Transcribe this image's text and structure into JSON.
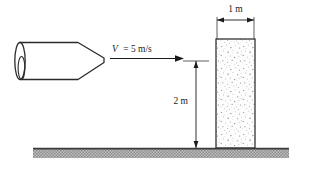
{
  "figure": {
    "labels": {
      "velocity": "V = 5 m/s",
      "velocity_symbol": "V",
      "velocity_value": "= 5 m/s",
      "wall_width": "1 m",
      "wall_height": "2 m"
    },
    "colors": {
      "line": "#1a1a1a",
      "outline": "#2b2b2b",
      "wall_fill": "#fdfdfd",
      "stipple": "#6b6b6b",
      "ground_fill": "#9a9a9a",
      "ground_line": "#3a3a3a",
      "background": "#ffffff"
    },
    "elements": {
      "nozzle_name": "nozzle",
      "jet_name": "water-jet",
      "wall_name": "wall",
      "ground_name": "ground"
    }
  }
}
